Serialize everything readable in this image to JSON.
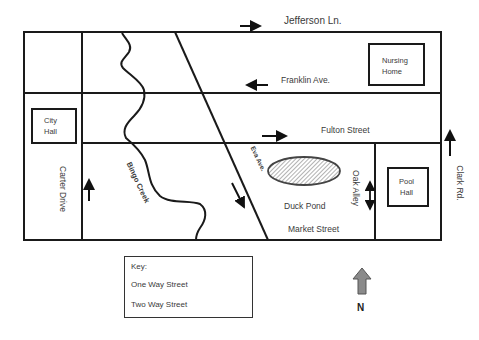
{
  "map": {
    "streets": {
      "jefferson": "Jefferson Ln.",
      "franklin": "Franklin Ave.",
      "fulton": "Fulton Street",
      "market": "Market Street",
      "carter": "Carter Drive",
      "clark": "Clark Rd.",
      "eva": "Eva Ave.",
      "oak": "Oak Alley"
    },
    "features": {
      "creek": "Bingo Creek",
      "pond": "Duck Pond"
    },
    "buildings": {
      "nursing_home_line1": "Nursing",
      "nursing_home_line2": "Home",
      "city_hall_line1": "City",
      "city_hall_line2": "Hall",
      "pool_hall_line1": "Pool",
      "pool_hall_line2": "Hall"
    },
    "directions": {
      "jefferson": "east (one way)",
      "franklin": "west (one way)",
      "fulton": "east (one way)",
      "carter": "north (one way)",
      "clark": "north (one way)",
      "eva": "southeast (one way)",
      "oak": "two way (north-south)"
    }
  },
  "key": {
    "title": "Key:",
    "one_way": "One Way Street",
    "two_way": "Two Way Street"
  },
  "compass": {
    "label": "N"
  },
  "colors": {
    "line": "#1a1a1a",
    "compass_fill": "#8a8a8a",
    "pond_hatch": "#555555"
  }
}
